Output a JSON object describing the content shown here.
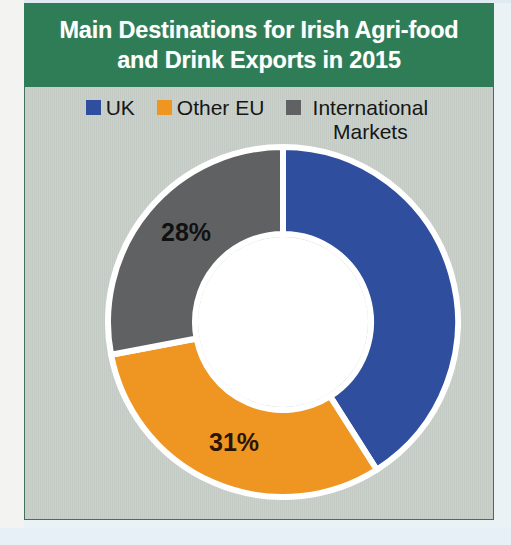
{
  "title": "Main Destinations for Irish Agri-food and Drink Exports in 2015",
  "title_line1": "Main Destinations for Irish Agri-food",
  "title_line2": "and Drink Exports in 2015",
  "colors": {
    "banner_green": "#2e7d57",
    "panel_background": "#c6cec7",
    "panel_border": "#42705b",
    "uk_blue": "#2f4e9e",
    "other_eu_orange": "#ef9522",
    "international_gray": "#5f6163",
    "separator_white": "#ffffff",
    "label_text": "#1d1208"
  },
  "legend": {
    "position": "top-center",
    "items": [
      {
        "label": "UK",
        "color": "#2f4e9e",
        "swatch_name": "legend-swatch-uk"
      },
      {
        "label": "Other EU",
        "color": "#ef9522",
        "swatch_name": "legend-swatch-other-eu"
      },
      {
        "label": "International Markets",
        "color": "#5f6163",
        "swatch_name": "legend-swatch-international"
      }
    ]
  },
  "chart_data": {
    "type": "pie",
    "variant": "donut",
    "title": "Main Destinations for Irish Agri-food and Drink Exports in 2015",
    "xlabel": "",
    "ylabel": "",
    "units": "percent",
    "start_angle_deg": 0,
    "direction": "clockwise",
    "inner_radius_ratio": 0.5,
    "legend_position": "top",
    "grid": false,
    "categories": [
      "UK",
      "Other EU",
      "International Markets"
    ],
    "values": [
      41,
      31,
      28
    ],
    "labels_shown": [
      "",
      "31%",
      "28%"
    ],
    "slices": [
      {
        "name": "UK",
        "value": 41,
        "display_label": "",
        "label_visible": false,
        "color": "#2f4e9e",
        "start_deg": 0,
        "end_deg": 147.6
      },
      {
        "name": "Other EU",
        "value": 31,
        "display_label": "31%",
        "label_visible": true,
        "color": "#ef9522",
        "start_deg": 147.6,
        "end_deg": 259.2
      },
      {
        "name": "International Markets",
        "value": 28,
        "display_label": "28%",
        "label_visible": true,
        "color": "#5f6163",
        "start_deg": 259.2,
        "end_deg": 360
      }
    ]
  }
}
